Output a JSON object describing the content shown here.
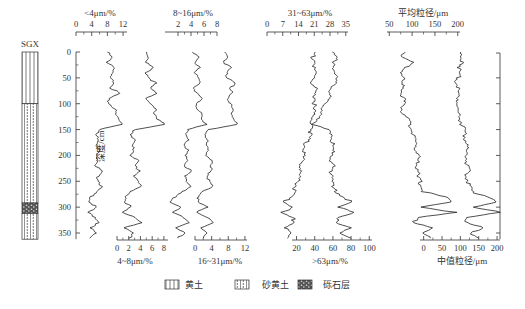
{
  "section_label": "SGX",
  "depth_axis": {
    "label": "深度/cm",
    "ticks": [
      0,
      50,
      100,
      150,
      200,
      250,
      300,
      350
    ],
    "range": [
      0,
      360
    ]
  },
  "legend": [
    {
      "name": "loess",
      "label": "黄土"
    },
    {
      "name": "sandy-loess",
      "label": "砂黄土"
    },
    {
      "name": "gravel",
      "label": "砾石层"
    }
  ],
  "lithology": [
    {
      "type": "loess",
      "from": 0,
      "to": 100
    },
    {
      "type": "sandy-loess",
      "from": 100,
      "to": 292
    },
    {
      "type": "gravel",
      "from": 292,
      "to": 312
    },
    {
      "type": "sandy-loess",
      "from": 312,
      "to": 362
    }
  ],
  "chart_data": {
    "type": "line",
    "ylabel": "深度/cm",
    "ylim": [
      0,
      360
    ],
    "y_inverted": true,
    "depths": [
      0,
      10,
      20,
      30,
      40,
      50,
      60,
      70,
      80,
      90,
      100,
      110,
      120,
      130,
      140,
      150,
      160,
      170,
      180,
      190,
      200,
      210,
      220,
      230,
      240,
      250,
      260,
      270,
      280,
      290,
      300,
      310,
      320,
      330,
      340,
      350,
      360
    ],
    "series": [
      {
        "name": "<4μm/%",
        "axis": "top",
        "ticks": [
          0,
          4,
          8,
          12
        ],
        "xlim": [
          0,
          13
        ],
        "values": [
          8,
          9,
          8,
          10,
          9,
          8.5,
          10,
          9,
          11,
          8,
          8.5,
          10,
          10,
          11,
          12,
          6,
          5,
          6,
          5.5,
          6,
          5,
          6,
          5,
          6.5,
          5.5,
          6,
          6.5,
          5,
          4,
          3.5,
          5,
          3,
          5,
          6,
          3.5,
          5,
          3.5
        ]
      },
      {
        "name": "4~8μm/%",
        "axis": "bottom",
        "ticks": [
          0,
          2,
          4,
          6,
          8
        ],
        "xlim": [
          0,
          8.7
        ],
        "values": [
          5,
          5.5,
          5,
          6,
          5,
          5.5,
          6.5,
          5.5,
          7,
          5,
          5.5,
          6.5,
          6.5,
          7,
          8,
          3,
          2.5,
          3,
          2.5,
          3,
          2.5,
          3.5,
          3,
          4,
          3,
          3.5,
          4,
          2.5,
          1.5,
          1,
          2.5,
          1,
          3,
          4,
          1.5,
          3,
          2
        ]
      },
      {
        "name": "8~16μm/%",
        "axis": "top",
        "ticks": [
          2,
          4,
          6,
          8
        ],
        "xlim": [
          0,
          8
        ],
        "values": [
          4.5,
          5,
          4.5,
          5.5,
          4.5,
          5,
          5.5,
          4.5,
          5,
          5.5,
          5,
          5,
          5.5,
          5.5,
          6.5,
          3.5,
          3,
          3.5,
          3,
          3.5,
          3,
          3.5,
          3,
          4,
          3,
          3.5,
          4,
          2.5,
          1.5,
          1,
          2.5,
          1,
          3,
          4,
          1.5,
          3,
          2
        ]
      },
      {
        "name": "16~31μm/%",
        "axis": "bottom",
        "ticks": [
          0,
          4,
          8,
          12
        ],
        "xlim": [
          0,
          12.5
        ],
        "values": [
          7,
          8,
          7,
          8.5,
          7.5,
          8,
          10,
          8,
          9,
          8,
          8.5,
          9,
          9,
          9.5,
          10,
          3,
          2.5,
          3,
          2.5,
          3,
          3,
          4,
          3.5,
          4,
          3,
          3.5,
          4,
          2,
          1,
          0.5,
          3,
          0.5,
          3,
          4,
          1.5,
          3,
          2
        ]
      },
      {
        "name": "31~63μm/%",
        "axis": "top",
        "ticks": [
          0,
          7,
          14,
          21,
          28,
          35
        ],
        "xlim": [
          0,
          36
        ],
        "values": [
          30,
          31,
          29,
          30,
          31,
          30,
          30,
          29,
          28,
          27,
          26,
          25,
          24,
          22,
          21,
          20,
          19,
          18,
          17,
          17,
          16,
          16,
          15,
          15,
          14,
          14,
          13,
          12,
          10,
          8,
          12,
          6,
          11,
          13,
          8,
          10,
          9
        ]
      },
      {
        "name": ">63μm/%",
        "axis": "bottom",
        "ticks": [
          20,
          40,
          60,
          80,
          100
        ],
        "xlim": [
          15,
          103
        ],
        "values": [
          40,
          38,
          41,
          38,
          40,
          40,
          36,
          40,
          38,
          41,
          40,
          38,
          39,
          38,
          36,
          55,
          60,
          58,
          60,
          59,
          60,
          58,
          60,
          57,
          62,
          60,
          58,
          64,
          72,
          80,
          65,
          85,
          68,
          62,
          78,
          70,
          80
        ]
      },
      {
        "name": "平均粒径/μm",
        "axis": "top",
        "ticks": [
          50,
          100,
          150,
          200
        ],
        "xlim": [
          45,
          205
        ],
        "values": [
          85,
          80,
          100,
          85,
          78,
          80,
          75,
          82,
          78,
          80,
          82,
          78,
          80,
          90,
          95,
          100,
          102,
          105,
          110,
          108,
          115,
          112,
          110,
          115,
          110,
          118,
          120,
          125,
          170,
          190,
          120,
          195,
          110,
          105,
          150,
          120,
          140
        ]
      },
      {
        "name": "中值粒径/μm",
        "axis": "bottom",
        "ticks": [
          0,
          50,
          100,
          150,
          200
        ],
        "xlim": [
          -10,
          208
        ],
        "values": [
          100,
          95,
          110,
          98,
          92,
          95,
          90,
          96,
          92,
          95,
          95,
          92,
          95,
          100,
          105,
          110,
          112,
          115,
          118,
          115,
          120,
          118,
          116,
          120,
          118,
          122,
          125,
          130,
          180,
          200,
          130,
          210,
          120,
          115,
          160,
          130,
          150
        ]
      }
    ],
    "legend": [
      "黄土",
      "砂黄土",
      "砾石层"
    ]
  }
}
